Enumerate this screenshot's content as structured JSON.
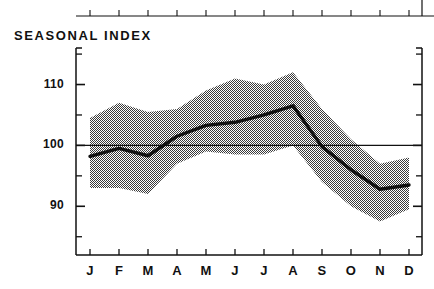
{
  "chart_data": {
    "type": "line",
    "title": "SEASONAL INDEX",
    "xlabel": "",
    "ylabel": "",
    "categories": [
      "J",
      "F",
      "M",
      "A",
      "M",
      "J",
      "J",
      "A",
      "S",
      "O",
      "N",
      "D"
    ],
    "category_names": [
      "January",
      "February",
      "March",
      "April",
      "May",
      "June",
      "July",
      "August",
      "September",
      "October",
      "November",
      "December"
    ],
    "ylim": [
      82,
      116
    ],
    "xlim": [
      0,
      13
    ],
    "y_major_ticks": [
      90,
      100,
      110
    ],
    "y_major_tick_labels": [
      "90",
      "100",
      "110"
    ],
    "y_minor_ticks": [
      85,
      95,
      105,
      115
    ],
    "grid": false,
    "reference_line": 100,
    "legend": "none",
    "series": [
      {
        "name": "Seasonal index",
        "kind": "line",
        "values": [
          98.2,
          99.5,
          98.3,
          101.5,
          103.3,
          103.8,
          105.0,
          106.5,
          99.8,
          96.0,
          92.8,
          93.5
        ]
      },
      {
        "name": "Upper band",
        "kind": "band_upper",
        "values": [
          104.5,
          107.0,
          105.5,
          106.0,
          109.0,
          111.0,
          110.0,
          112.0,
          106.0,
          101.0,
          97.0,
          98.0
        ]
      },
      {
        "name": "Lower band",
        "kind": "band_lower",
        "values": [
          93.0,
          93.0,
          92.0,
          97.0,
          99.0,
          98.5,
          98.5,
          100.0,
          94.0,
          90.0,
          87.5,
          89.5
        ]
      }
    ],
    "colors": {
      "line": "#111111",
      "band": "#9a9a9a",
      "axis": "#111111",
      "background": "#ffffff"
    }
  },
  "axis": {
    "y_labels": [
      "110",
      "100",
      "90"
    ],
    "x_labels": [
      "J",
      "F",
      "M",
      "A",
      "M",
      "J",
      "J",
      "A",
      "S",
      "O",
      "N",
      "D"
    ]
  }
}
